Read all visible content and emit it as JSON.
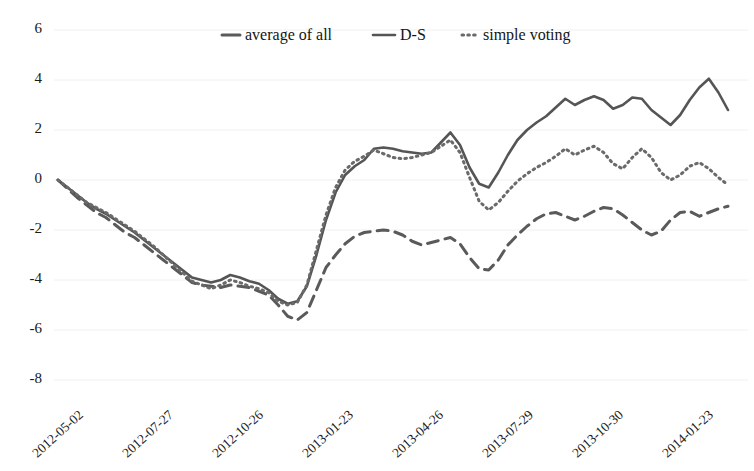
{
  "chart_data": {
    "type": "line",
    "title": "",
    "xlabel": "",
    "ylabel": "",
    "ylim": [
      -8,
      6
    ],
    "yticks": [
      6,
      4,
      2,
      0,
      -2,
      -4,
      -6,
      -8
    ],
    "grid": true,
    "legend_position": "top-center",
    "xtick_labels": [
      "2012-05-02",
      "2012-07-27",
      "2012-10-26",
      "2013-01-23",
      "2013-04-26",
      "2013-07-29",
      "2013-10-30",
      "2014-01-23"
    ],
    "x_index": [
      0,
      1,
      2,
      3,
      4,
      5,
      6,
      7,
      8,
      9,
      10,
      11,
      12,
      13,
      14,
      15,
      16,
      17,
      18,
      19,
      20,
      21,
      22,
      23,
      24,
      25,
      26,
      27,
      28,
      29,
      30,
      31,
      32,
      33,
      34,
      35,
      36,
      37,
      38,
      39,
      40,
      41,
      42,
      43,
      44,
      45,
      46,
      47,
      48,
      49,
      50,
      51,
      52,
      53,
      54,
      55,
      56,
      57,
      58,
      59,
      60,
      61,
      62,
      63,
      64,
      65,
      66,
      67,
      68,
      69,
      70
    ],
    "series": [
      {
        "name": "average of all",
        "style": "dashed",
        "color": "#5a5a5a",
        "values": [
          0.0,
          -0.35,
          -0.7,
          -1.0,
          -1.3,
          -1.5,
          -1.8,
          -2.1,
          -2.3,
          -2.6,
          -2.9,
          -3.2,
          -3.5,
          -3.8,
          -4.1,
          -4.2,
          -4.25,
          -4.3,
          -4.2,
          -4.25,
          -4.3,
          -4.45,
          -4.6,
          -5.0,
          -5.45,
          -5.6,
          -5.3,
          -4.4,
          -3.5,
          -3.0,
          -2.55,
          -2.25,
          -2.1,
          -2.05,
          -2.0,
          -2.05,
          -2.2,
          -2.45,
          -2.6,
          -2.5,
          -2.4,
          -2.3,
          -2.55,
          -3.1,
          -3.55,
          -3.6,
          -3.2,
          -2.6,
          -2.2,
          -1.85,
          -1.55,
          -1.35,
          -1.3,
          -1.45,
          -1.6,
          -1.45,
          -1.25,
          -1.1,
          -1.15,
          -1.4,
          -1.7,
          -2.0,
          -2.2,
          -2.05,
          -1.6,
          -1.3,
          -1.25,
          -1.45,
          -1.3,
          -1.15,
          -1.05
        ]
      },
      {
        "name": "D-S",
        "style": "solid",
        "color": "#555555",
        "values": [
          0.0,
          -0.3,
          -0.6,
          -0.9,
          -1.15,
          -1.35,
          -1.6,
          -1.85,
          -2.1,
          -2.4,
          -2.7,
          -3.0,
          -3.3,
          -3.6,
          -3.9,
          -4.0,
          -4.1,
          -4.0,
          -3.8,
          -3.9,
          -4.05,
          -4.15,
          -4.4,
          -4.75,
          -4.95,
          -4.85,
          -4.25,
          -3.0,
          -1.6,
          -0.5,
          0.2,
          0.55,
          0.8,
          1.25,
          1.3,
          1.25,
          1.15,
          1.1,
          1.05,
          1.1,
          1.5,
          1.9,
          1.4,
          0.5,
          -0.15,
          -0.3,
          0.3,
          1.0,
          1.6,
          2.0,
          2.3,
          2.55,
          2.9,
          3.25,
          3.0,
          3.2,
          3.35,
          3.2,
          2.85,
          3.0,
          3.3,
          3.25,
          2.8,
          2.5,
          2.2,
          2.6,
          3.2,
          3.7,
          4.05,
          3.5,
          2.8
        ]
      },
      {
        "name": "simple voting",
        "style": "dotted",
        "color": "#6a6a6a",
        "values": [
          0.0,
          -0.3,
          -0.6,
          -0.9,
          -1.1,
          -1.3,
          -1.55,
          -1.8,
          -2.05,
          -2.35,
          -2.65,
          -3.0,
          -3.35,
          -3.7,
          -4.05,
          -4.2,
          -4.35,
          -4.2,
          -4.0,
          -4.1,
          -4.25,
          -4.35,
          -4.5,
          -4.85,
          -5.0,
          -4.9,
          -4.2,
          -2.8,
          -1.4,
          -0.3,
          0.4,
          0.75,
          0.95,
          1.2,
          1.05,
          0.9,
          0.85,
          0.9,
          1.0,
          1.1,
          1.35,
          1.6,
          1.1,
          0.1,
          -0.85,
          -1.2,
          -0.9,
          -0.45,
          -0.05,
          0.25,
          0.5,
          0.7,
          0.95,
          1.25,
          1.0,
          1.2,
          1.35,
          1.1,
          0.65,
          0.45,
          0.9,
          1.25,
          0.9,
          0.3,
          0.0,
          0.2,
          0.55,
          0.7,
          0.45,
          0.1,
          -0.2
        ]
      }
    ]
  },
  "legend": {
    "items": [
      {
        "label": "average of all",
        "style": "dashed"
      },
      {
        "label": "D-S",
        "style": "solid"
      },
      {
        "label": "simple voting",
        "style": "dotted"
      }
    ]
  }
}
